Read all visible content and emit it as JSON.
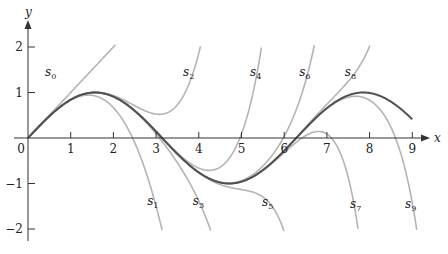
{
  "chart_data": {
    "type": "line",
    "title": "",
    "xlabel": "x",
    "ylabel": "y",
    "xlim": [
      0,
      9.3
    ],
    "ylim": [
      -2.2,
      2.6
    ],
    "grid": false,
    "legend": "none (inline curve labels)",
    "x_ticks": [
      0,
      1,
      2,
      3,
      4,
      5,
      6,
      7,
      8,
      9
    ],
    "x_tick_labels": [
      "0",
      "1",
      "2",
      "3",
      "4",
      "5",
      "6",
      "7",
      "8",
      "9"
    ],
    "y_ticks": [
      2,
      1,
      -1,
      -2
    ],
    "y_tick_labels": [
      "2",
      "1",
      "−1",
      "−2"
    ],
    "colors": {
      "main_curve": "#505050",
      "approx_curves": "#b4b4b4",
      "axes": "#333333"
    },
    "series": [
      {
        "name": "sin x",
        "kind": "main",
        "function": "sin",
        "domain": [
          0,
          9
        ]
      },
      {
        "name": "s0",
        "label": "s",
        "sub": "0",
        "degree": 1,
        "label_pos": [
          0.4,
          1.36
        ]
      },
      {
        "name": "s1",
        "label": "s",
        "sub": "1",
        "degree": 3,
        "label_pos": [
          2.79,
          -1.48
        ]
      },
      {
        "name": "s2",
        "label": "s",
        "sub": "2",
        "degree": 5,
        "label_pos": [
          3.63,
          1.36
        ]
      },
      {
        "name": "s3",
        "label": "s",
        "sub": "3",
        "degree": 7,
        "label_pos": [
          3.86,
          -1.48
        ]
      },
      {
        "name": "s4",
        "label": "s",
        "sub": "4",
        "degree": 9,
        "label_pos": [
          5.2,
          1.36
        ]
      },
      {
        "name": "s5",
        "label": "s",
        "sub": "5",
        "degree": 11,
        "label_pos": [
          5.48,
          -1.5
        ]
      },
      {
        "name": "s6",
        "label": "s",
        "sub": "6",
        "degree": 13,
        "label_pos": [
          6.35,
          1.36
        ]
      },
      {
        "name": "s7",
        "label": "s",
        "sub": "7",
        "degree": 15,
        "label_pos": [
          7.54,
          -1.54
        ]
      },
      {
        "name": "s8",
        "label": "s",
        "sub": "8",
        "degree": 17,
        "label_pos": [
          7.42,
          1.36
        ]
      },
      {
        "name": "s9",
        "label": "s",
        "sub": "9",
        "degree": 19,
        "label_pos": [
          8.83,
          -1.54
        ]
      }
    ],
    "clip_y": [
      -2.05,
      2.05
    ]
  }
}
